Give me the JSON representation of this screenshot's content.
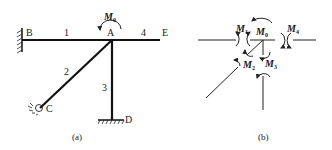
{
  "figure_a": {
    "caption": "(a)",
    "nodes": {
      "B": "B",
      "A": "A",
      "E": "E",
      "C": "C",
      "D": "D"
    },
    "members": [
      "1",
      "2",
      "3",
      "4"
    ],
    "applied_moment": {
      "symbol": "M",
      "subscript": "0"
    },
    "supports": {
      "B": "fixed",
      "C": "pinned",
      "D": "fixed"
    }
  },
  "figure_b": {
    "caption": "(b)",
    "moments": [
      {
        "symbol": "M",
        "subscript": "0"
      },
      {
        "symbol": "M",
        "subscript": "1"
      },
      {
        "symbol": "M",
        "subscript": "2"
      },
      {
        "symbol": "M",
        "subscript": "3"
      },
      {
        "symbol": "M",
        "subscript": "4"
      }
    ]
  }
}
